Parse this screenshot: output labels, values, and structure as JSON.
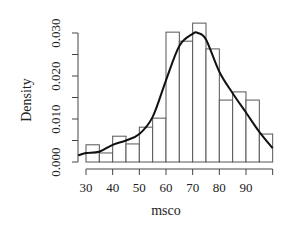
{
  "chart_data": {
    "type": "bar",
    "subtype": "histogram_with_density_curve",
    "title": "",
    "xlabel": "msco",
    "ylabel": "Density",
    "bin_width": 5,
    "bin_edges": [
      30,
      35,
      40,
      45,
      50,
      55,
      60,
      65,
      70,
      75,
      80,
      85,
      90,
      95,
      100
    ],
    "categories": [
      "30-35",
      "35-40",
      "40-45",
      "45-50",
      "50-55",
      "55-60",
      "60-65",
      "65-70",
      "70-75",
      "75-80",
      "80-85",
      "85-90",
      "90-95",
      "95-100"
    ],
    "values": [
      0.004,
      0.0021,
      0.006,
      0.0042,
      0.0081,
      0.0102,
      0.0302,
      0.0281,
      0.0323,
      0.0263,
      0.0144,
      0.0163,
      0.0144,
      0.0065
    ],
    "density_curve": {
      "x": [
        27,
        30,
        35,
        40,
        45,
        50,
        55,
        60,
        65,
        70,
        72,
        75,
        80,
        85,
        90,
        95,
        100
      ],
      "y": [
        0.0015,
        0.0021,
        0.0024,
        0.004,
        0.005,
        0.0065,
        0.0105,
        0.019,
        0.027,
        0.0298,
        0.03,
        0.0285,
        0.021,
        0.016,
        0.0115,
        0.007,
        0.0032
      ]
    },
    "xticks": [
      30,
      40,
      50,
      60,
      70,
      80,
      90
    ],
    "xtick_labels": [
      "30",
      "40",
      "50",
      "60",
      "70",
      "80",
      "90"
    ],
    "yticks": [
      0.0,
      0.005,
      0.01,
      0.015,
      0.02,
      0.025,
      0.03
    ],
    "ytick_labels": [
      "0.000",
      "0.010",
      "0.020",
      "0.030"
    ],
    "xlim": [
      27,
      101
    ],
    "ylim": [
      0,
      0.031
    ],
    "grid": false,
    "legend": null
  }
}
